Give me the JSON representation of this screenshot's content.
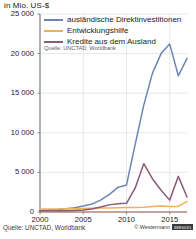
{
  "chart_data": {
    "type": "line",
    "title": "in Mio. US-$",
    "xlabel": "",
    "ylabel": "in Mio. US-$",
    "xlim": [
      2000,
      2017
    ],
    "ylim": [
      0,
      25000
    ],
    "xticks": [
      "2000",
      "2005",
      "2010",
      "2015"
    ],
    "xtick_values": [
      2000,
      2005,
      2010,
      2015
    ],
    "yticks": [
      "0",
      "5 000",
      "10 000",
      "15 000",
      "20 000",
      "25 000"
    ],
    "ytick_values": [
      0,
      5000,
      10000,
      15000,
      20000,
      25000
    ],
    "grid": true,
    "legend_position": "top-right-inside",
    "x": [
      2000,
      2001,
      2002,
      2003,
      2004,
      2005,
      2006,
      2007,
      2008,
      2009,
      2010,
      2011,
      2012,
      2013,
      2014,
      2015,
      2016,
      2017
    ],
    "series": [
      {
        "name": "ausländische Direktinvestitionen",
        "color": "#6b85b5",
        "values": [
          200,
          250,
          300,
          400,
          550,
          750,
          1000,
          1500,
          2200,
          3100,
          3400,
          8500,
          13500,
          17500,
          20000,
          21200,
          17200,
          19400
        ]
      },
      {
        "name": "Entwicklungshilfe",
        "color": "#edb259",
        "values": [
          380,
          380,
          380,
          400,
          420,
          450,
          480,
          500,
          520,
          540,
          560,
          580,
          600,
          680,
          760,
          700,
          700,
          1350
        ]
      },
      {
        "name": "Kredite aus dem Ausland",
        "color": "#8a5a79",
        "values": [
          150,
          150,
          160,
          170,
          200,
          250,
          380,
          620,
          900,
          1050,
          1100,
          3000,
          6100,
          4200,
          2750,
          1500,
          4500,
          1900
        ]
      }
    ],
    "source_note": "Quelle: UNCTAD, Worldbank"
  },
  "footer": {
    "source": "Quelle: UNCTAD, Worldbank",
    "credit": "© Westermann",
    "credit_code": "3885031"
  }
}
